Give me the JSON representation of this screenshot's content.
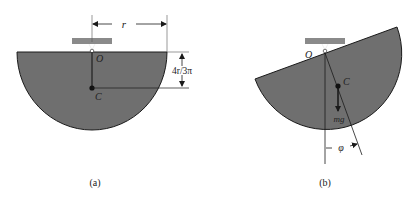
{
  "figure_a": {
    "caption": "(a)",
    "pivot_label": "O",
    "centroid_label": "C",
    "radius_label": "r",
    "centroid_offset_label": "4r/3π"
  },
  "figure_b": {
    "caption": "(b)",
    "pivot_label": "O",
    "centroid_label": "C",
    "weight_label": "mg",
    "angle_label": "φ"
  },
  "colors": {
    "body_fill": "#6f6f6f",
    "support_fill": "#8a8a8a",
    "line": "#1a1a1a"
  }
}
